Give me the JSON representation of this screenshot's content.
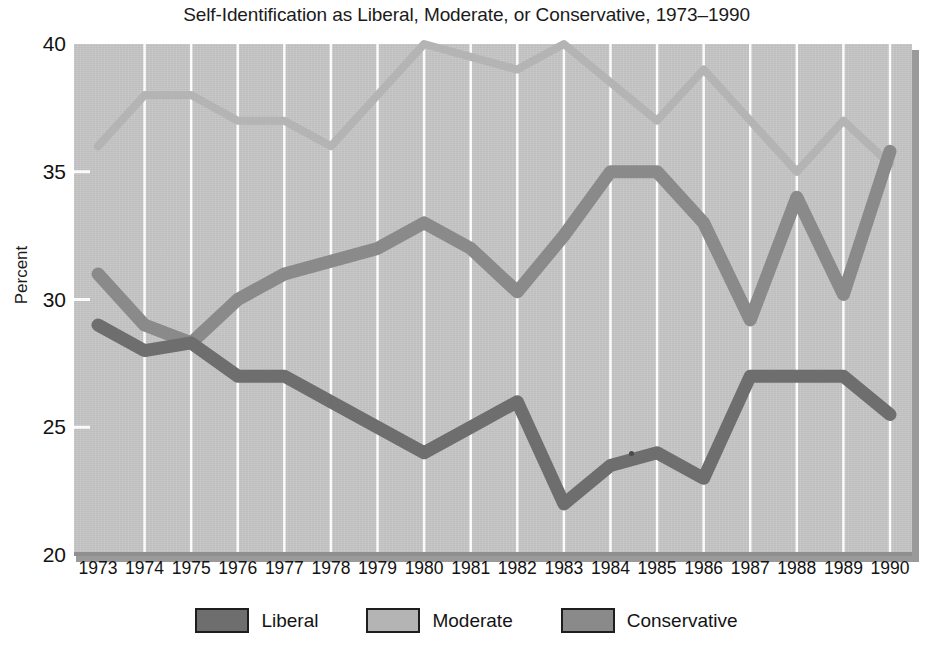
{
  "chart_data": {
    "type": "line",
    "title": "Self-Identification as Liberal, Moderate, or Conservative, 1973–1990",
    "xlabel": "",
    "ylabel": "Percent",
    "ylim": [
      20,
      40
    ],
    "yticks": [
      40,
      35,
      30,
      25,
      20
    ],
    "grid": "vertical-white",
    "legend_position": "bottom",
    "categories": [
      "1973",
      "1974",
      "1975",
      "1976",
      "1977",
      "1978",
      "1979",
      "1980",
      "1981",
      "1982",
      "1983",
      "1984",
      "1985",
      "1986",
      "1987",
      "1988",
      "1989",
      "1990"
    ],
    "series": [
      {
        "name": "Liberal",
        "color": "#6e6e6e",
        "values": [
          29.0,
          28.0,
          28.3,
          27.0,
          27.0,
          26.0,
          25.0,
          24.0,
          25.0,
          26.0,
          22.0,
          23.5,
          24.0,
          23.0,
          27.0,
          27.0,
          27.0,
          25.5
        ]
      },
      {
        "name": "Moderate",
        "color": "#b4b4b4",
        "values": [
          36.0,
          38.0,
          38.0,
          37.0,
          37.0,
          36.0,
          38.0,
          40.0,
          39.5,
          39.0,
          40.0,
          38.5,
          37.0,
          39.0,
          37.0,
          35.0,
          37.0,
          35.3
        ]
      },
      {
        "name": "Conservative",
        "color": "#8a8a8a",
        "values": [
          31.0,
          29.0,
          28.3,
          30.0,
          31.0,
          31.5,
          32.0,
          33.0,
          32.0,
          30.3,
          32.5,
          35.0,
          35.0,
          33.0,
          29.2,
          34.0,
          30.2,
          35.8
        ]
      }
    ]
  },
  "legend": {
    "items": [
      {
        "label": "Liberal",
        "color": "#6e6e6e"
      },
      {
        "label": "Moderate",
        "color": "#b4b4b4"
      },
      {
        "label": "Conservative",
        "color": "#8a8a8a"
      }
    ]
  },
  "colors": {
    "plot_background": "#c3c3c3",
    "gridline": "#ffffff",
    "axis": "#8f8f8f",
    "text": "#121212"
  }
}
